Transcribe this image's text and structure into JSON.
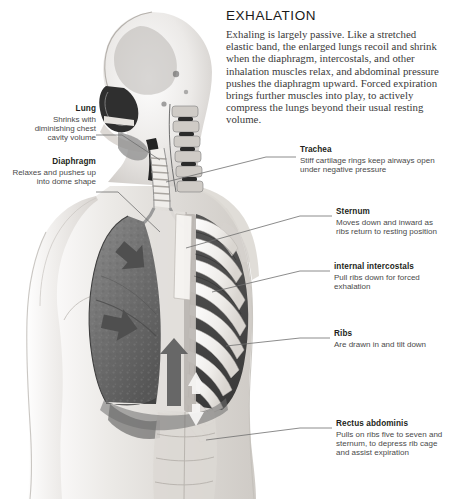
{
  "headline": {
    "title": "EXHALATION",
    "body": "Exhaling is largely passive. Like a stretched elastic band, the enlarged lungs recoil and shrink when the diaphragm, intercostals, and other inhalation muscles relax, and abdominal pressure pushes the diaphragm upward. Forced expiration brings further muscles into play, to actively compress the lungs beyond their usual resting volume."
  },
  "callouts": {
    "lung": {
      "heading": "Lung",
      "text": "Shrinks with diminishing chest cavity volume"
    },
    "diaphragm": {
      "heading": "Diaphragm",
      "text": "Relaxes and pushes up into dome shape"
    },
    "trachea": {
      "heading": "Trachea",
      "text": "Stiff cartilage rings keep airways open under negative pressure"
    },
    "sternum": {
      "heading": "Sternum",
      "text": "Moves down and inward as ribs return to resting position"
    },
    "internal_intercostals": {
      "heading": "internal intercostals",
      "text": "Pull ribs down for forced exhalation"
    },
    "ribs": {
      "heading": "Ribs",
      "text": "Are drawn in and tilt down"
    },
    "rectus_abdominis": {
      "heading": "Rectus abdominis",
      "text": "Pulls on ribs five to seven and sternum, to depress rib cage and assist expiration"
    }
  },
  "illustration": {
    "description": "Grayscale anatomical sagittal illustration of a human head, neck and torso showing lung, diaphragm, trachea, sternum, ribs and abdominal muscles with motion arrows",
    "arrows": [
      {
        "name": "lung-recoil-arrow-upper",
        "direction": "down-right"
      },
      {
        "name": "lung-recoil-arrow-lower",
        "direction": "right"
      },
      {
        "name": "diaphragm-rise-arrow",
        "direction": "up"
      },
      {
        "name": "abdominal-compression-arrow",
        "direction": "up-down"
      }
    ],
    "colors": {
      "skin": "#e9e6e2",
      "lung": "#6f6f6f",
      "bone": "#f2f0ee",
      "arrow": "#5a5a5a",
      "leader_line": "#6b6b6b"
    }
  }
}
